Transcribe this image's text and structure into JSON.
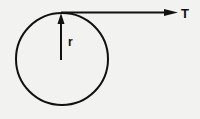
{
  "diagram": {
    "labels": {
      "radius": "r",
      "tension": "T"
    },
    "colors": {
      "background": "#f2f2f0",
      "stroke": "#111111"
    },
    "circle": {
      "cx": 62,
      "cy": 59,
      "r": 46
    },
    "tangent_arrow": {
      "from": [
        62,
        12
      ],
      "to": [
        178,
        12
      ]
    },
    "radius_arrow": {
      "from": [
        62,
        59
      ],
      "to": [
        62,
        13
      ]
    }
  }
}
